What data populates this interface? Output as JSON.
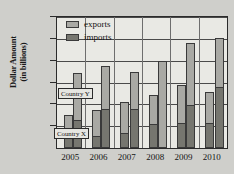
{
  "chart_data": {
    "type": "bar",
    "title": "",
    "xlabel": "",
    "ylabel": "Dollar Amount (in billions)",
    "ylabel_line1": "Dollar Amount",
    "ylabel_line2": "(in billions)",
    "categories": [
      "2005",
      "2006",
      "2007",
      "2008",
      "2009",
      "2010"
    ],
    "ylim": [
      0,
      120
    ],
    "yticks": [
      0,
      20,
      40,
      60,
      80,
      100,
      120
    ],
    "ytick_labels": [
      "",
      "20",
      "40",
      "60",
      "80",
      "100",
      "120"
    ],
    "grid": true,
    "legend_position": "top-left",
    "legend": [
      {
        "label": "exports",
        "color": "#a9a9a4"
      },
      {
        "label": "imports",
        "color": "#76766f"
      }
    ],
    "group_labels": [
      {
        "label": "Country X",
        "name": "country-x"
      },
      {
        "label": "Country Y",
        "name": "country-y"
      }
    ],
    "series": [
      {
        "name": "Country X imports",
        "group": "Country X",
        "part": "imports",
        "values": [
          9,
          11,
          13,
          22,
          23,
          23
        ]
      },
      {
        "name": "Country X exports",
        "group": "Country X",
        "part": "exports",
        "values": [
          21,
          24,
          29,
          27,
          35,
          28
        ]
      },
      {
        "name": "Country Y imports",
        "group": "Country Y",
        "part": "imports",
        "values": [
          25,
          36,
          36,
          0,
          39,
          56
        ]
      },
      {
        "name": "Country Y exports",
        "group": "Country Y",
        "part": "exports",
        "values": [
          44,
          39,
          34,
          80,
          57,
          45
        ]
      }
    ],
    "totals": {
      "country_x": [
        30,
        35,
        42,
        49,
        58,
        51
      ],
      "country_y": [
        69,
        75,
        70,
        80,
        96,
        101
      ]
    },
    "colors": {
      "exports": "#a9a9a4",
      "imports": "#76766f",
      "plot_background": "#e9e9e4",
      "page_background": "#cfcfcb",
      "axis": "#2b2b2b"
    }
  }
}
